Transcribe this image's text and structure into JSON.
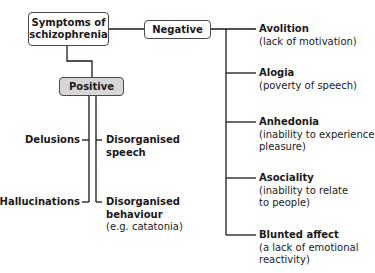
{
  "diagram": {
    "root": {
      "label_line1": "Symptoms of",
      "label_line2": "schizophrenia"
    },
    "positive": {
      "label": "Positive",
      "left_items": [
        {
          "title": "Delusions"
        },
        {
          "title": "Hallucinations"
        }
      ],
      "right_items": [
        {
          "title_line1": "Disorganised",
          "title_line2": "speech"
        },
        {
          "title_line1": "Disorganised",
          "title_line2": "behaviour",
          "desc": "(e.g. catatonia)"
        }
      ]
    },
    "negative": {
      "label": "Negative",
      "items": [
        {
          "title": "Avolition",
          "desc_line1": "(lack of motivation)"
        },
        {
          "title": "Alogia",
          "desc_line1": "(poverty of speech)"
        },
        {
          "title": "Anhedonia",
          "desc_line1": "(inability to experience",
          "desc_line2": "pleasure)"
        },
        {
          "title": "Asociality",
          "desc_line1": "(inability to relate",
          "desc_line2": "to people)"
        },
        {
          "title": "Blunted affect",
          "desc_line1": "(a lack of emotional",
          "desc_line2": "reactivity)"
        }
      ]
    },
    "colors": {
      "line": "#1a1a1a",
      "box_border": "#4a4a4a",
      "positive_fill": "#d6d6d6"
    }
  }
}
